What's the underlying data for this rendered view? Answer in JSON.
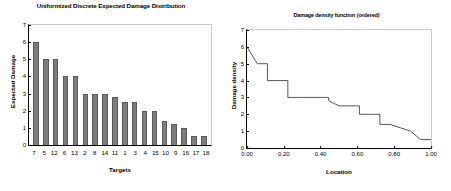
{
  "chart_data": [
    {
      "type": "bar",
      "title": "Uniformized Discrete Expected Damage Distribution",
      "xlabel": "Targets",
      "ylabel": "Expected Damage",
      "categories": [
        "7",
        "5",
        "12",
        "6",
        "13",
        "2",
        "8",
        "14",
        "11",
        "1",
        "3",
        "4",
        "15",
        "10",
        "9",
        "16",
        "17",
        "18"
      ],
      "values": [
        6,
        5,
        5,
        4,
        4,
        3,
        3,
        3,
        2.8,
        2.5,
        2.5,
        2,
        2,
        1.4,
        1.2,
        1,
        0.5,
        0.5
      ],
      "ylim": [
        0,
        7
      ],
      "yticks": [
        "0",
        "1",
        "2",
        "3",
        "4",
        "5",
        "6",
        "7"
      ],
      "grid": false,
      "legend": "none",
      "bar_color": "#7d7d7d",
      "bar_edge_color": "#5a5a5a"
    },
    {
      "type": "line",
      "title": "Damage density function (ordered)",
      "xlabel": "Location",
      "ylabel": "Damage density",
      "xlim": [
        0,
        1
      ],
      "ylim": [
        0,
        7
      ],
      "xticks": [
        "0.00",
        "0.20",
        "0.40",
        "0.60",
        "0.80",
        "1.00"
      ],
      "xtick_values": [
        0,
        0.2,
        0.4,
        0.6,
        0.8,
        1
      ],
      "yticks": [
        "0",
        "1",
        "2",
        "3",
        "4",
        "5",
        "6",
        "7"
      ],
      "grid": false,
      "legend": "none",
      "line_color": "#555555",
      "x": [
        0.0,
        0.056,
        0.111,
        0.111,
        0.167,
        0.222,
        0.222,
        0.278,
        0.333,
        0.389,
        0.444,
        0.444,
        0.5,
        0.556,
        0.611,
        0.611,
        0.667,
        0.722,
        0.722,
        0.778,
        0.833,
        0.889,
        0.944,
        1.0
      ],
      "y": [
        6.0,
        5.0,
        5.0,
        4.0,
        4.0,
        4.0,
        3.0,
        3.0,
        3.0,
        3.0,
        3.0,
        2.8,
        2.5,
        2.5,
        2.5,
        2.0,
        2.0,
        2.0,
        1.4,
        1.4,
        1.2,
        1.0,
        0.5,
        0.5
      ]
    }
  ]
}
